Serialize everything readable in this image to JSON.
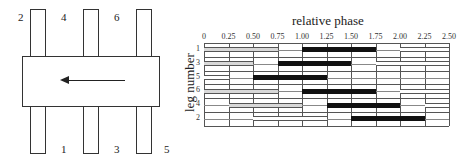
{
  "diagram": {
    "legs": [
      {
        "label": "2",
        "position": "top-left"
      },
      {
        "label": "4",
        "position": "top-middle"
      },
      {
        "label": "6",
        "position": "top-right"
      },
      {
        "label": "1",
        "position": "bottom-left"
      },
      {
        "label": "3",
        "position": "bottom-middle"
      },
      {
        "label": "5",
        "position": "bottom-right"
      }
    ],
    "arrow_direction": "left"
  },
  "chart_data": {
    "type": "gait-diagram",
    "title": "relative phase",
    "xlabel": "relative phase",
    "ylabel": "leg number",
    "x_ticks": [
      "0",
      "0.25",
      "0.50",
      "0.75",
      "1.00",
      "1.25",
      "1.50",
      "1.75",
      "2.00",
      "2.25",
      "2.50"
    ],
    "xlim": [
      0,
      2.5
    ],
    "rows": [
      "1",
      "3",
      "5",
      "6",
      "4",
      "2"
    ],
    "stance_bars": [
      {
        "leg": "1",
        "start": 1.0,
        "end": 1.75
      },
      {
        "leg": "3",
        "start": 0.75,
        "end": 1.5
      },
      {
        "leg": "5",
        "start": 0.5,
        "end": 1.25
      },
      {
        "leg": "6",
        "start": 1.0,
        "end": 1.75
      },
      {
        "leg": "4",
        "start": 1.25,
        "end": 2.0
      },
      {
        "leg": "2",
        "start": 1.5,
        "end": 2.25
      }
    ],
    "other_cycle_bars": [
      {
        "leg": "1",
        "start": 0.0,
        "end": 0.75,
        "style": "shaded"
      },
      {
        "leg": "1",
        "start": 2.0,
        "end": 2.5,
        "style": "outlined"
      },
      {
        "leg": "3",
        "start": 0.0,
        "end": 0.5,
        "style": "shaded"
      },
      {
        "leg": "3",
        "start": 1.75,
        "end": 2.5,
        "style": "outlined"
      },
      {
        "leg": "5",
        "start": 0.0,
        "end": 0.25,
        "style": "outlined"
      },
      {
        "leg": "6",
        "start": 0.0,
        "end": 0.75,
        "style": "shaded"
      },
      {
        "leg": "6",
        "start": 2.0,
        "end": 2.5,
        "style": "outlined"
      },
      {
        "leg": "4",
        "start": 0.25,
        "end": 1.0,
        "style": "shaded"
      },
      {
        "leg": "4",
        "start": 2.25,
        "end": 2.5,
        "style": "outlined"
      },
      {
        "leg": "2",
        "start": 0.5,
        "end": 1.25,
        "style": "outlined"
      }
    ],
    "grid": true
  }
}
